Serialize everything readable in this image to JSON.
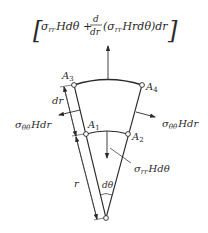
{
  "diagram": {
    "title_expression": "[σrr Hdθ + d/dr (σrr Hrdθ) dr]",
    "parts": {
      "bracket_left": "[",
      "bracket_right": "]",
      "term1_sigma": "σ",
      "term1_sub": "rr",
      "term1_rest": "Hdθ +",
      "frac_num": "d",
      "frac_den": "dr",
      "term2_open": "(σ",
      "term2_sub": "rr",
      "term2_rest": "Hrdθ)dr"
    },
    "points": {
      "A1": "A",
      "A1_sub": "1",
      "A2": "A",
      "A2_sub": "2",
      "A3": "A",
      "A3_sub": "3",
      "A4": "A",
      "A4_sub": "4"
    },
    "labels": {
      "dr": "dr",
      "r": "r",
      "dtheta": "dθ",
      "left_force_sigma": "σ",
      "left_force_sub": "θθ",
      "left_force_rest": "Hdr",
      "right_force_sigma": "σ",
      "right_force_sub": "θθ",
      "right_force_rest": "Hdr",
      "bottom_force_sigma": "σ",
      "bottom_force_sub": "rr",
      "bottom_force_rest": "Hdθ"
    }
  }
}
